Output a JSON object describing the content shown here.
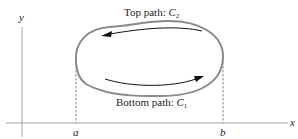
{
  "diagram": {
    "axes": {
      "x_label": "x",
      "y_label": "y"
    },
    "ticks": {
      "a": "a",
      "b": "b"
    },
    "top_path": {
      "text": "Top path: ",
      "curve": "C",
      "sub": "2"
    },
    "bottom_path": {
      "text": "Bottom path: ",
      "curve": "C",
      "sub": "1"
    },
    "colors": {
      "curve": "#8a8a8a",
      "arrow": "#111111",
      "axis": "#999999",
      "text": "#222222"
    }
  }
}
